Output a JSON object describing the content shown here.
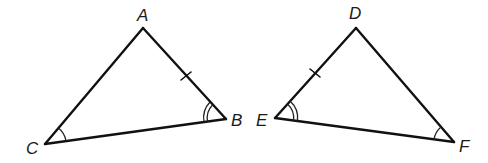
{
  "diagram": {
    "type": "congruent-triangles",
    "colors": {
      "stroke": "#111111",
      "background": "#ffffff"
    },
    "triangles": [
      {
        "name": "triangle-abc",
        "vertices": [
          {
            "label": "A",
            "x": 143,
            "y": 28
          },
          {
            "label": "B",
            "x": 226,
            "y": 119
          },
          {
            "label": "C",
            "x": 45,
            "y": 144
          }
        ],
        "marks": {
          "side_tick": "AB (single tick)",
          "angle_single_arc": "C",
          "angle_double_arc": "B"
        }
      },
      {
        "name": "triangle-def",
        "vertices": [
          {
            "label": "D",
            "x": 356,
            "y": 28
          },
          {
            "label": "E",
            "x": 275,
            "y": 118
          },
          {
            "label": "F",
            "x": 454,
            "y": 142
          }
        ],
        "marks": {
          "side_tick": "DE (single tick)",
          "angle_single_arc": "F",
          "angle_double_arc": "E"
        }
      }
    ],
    "labels": {
      "A": "A",
      "B": "B",
      "C": "C",
      "D": "D",
      "E": "E",
      "F": "F"
    }
  }
}
